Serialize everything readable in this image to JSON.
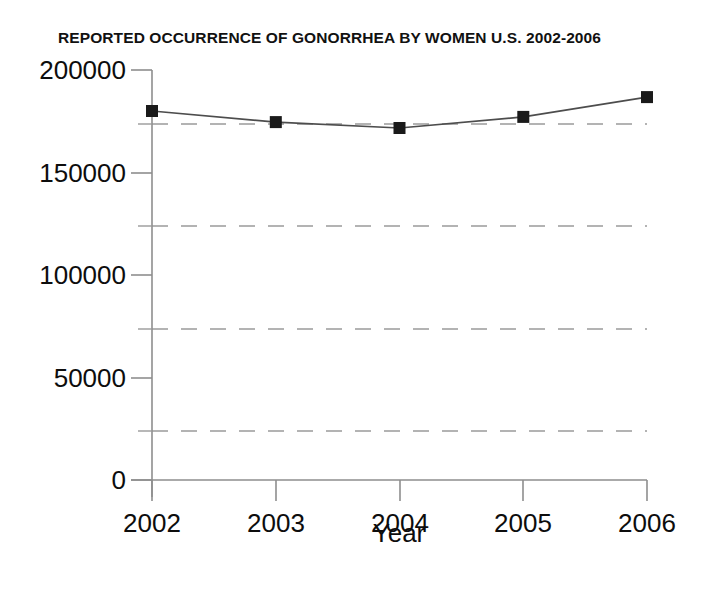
{
  "chart_data": {
    "type": "line",
    "title": "REPORTED OCCURRENCE OF GONORRHEA BY WOMEN U.S. 2002-2006",
    "xlabel": "Year",
    "ylabel": "",
    "categories": [
      "2002",
      "2003",
      "2004",
      "2005",
      "2006"
    ],
    "x": [
      2002,
      2003,
      2004,
      2005,
      2006
    ],
    "values": [
      180000,
      174600,
      171700,
      177100,
      186800
    ],
    "series": [
      {
        "name": "Reported occurrence of gonorrhea by women",
        "values": [
          180000,
          174600,
          171700,
          177100,
          186800
        ]
      }
    ],
    "ylim": [
      0,
      200000
    ],
    "xlim": [
      2002,
      2006
    ],
    "y_major_ticks": [
      0,
      50000,
      100000,
      150000,
      200000
    ],
    "y_major_tick_labels": [
      "0",
      "50000",
      "100000",
      "150000",
      "200000"
    ],
    "y_minor_ticks": [
      25000,
      75000,
      125000,
      175000
    ],
    "x_ticks": [
      2002,
      2003,
      2004,
      2005,
      2006
    ],
    "x_tick_labels": [
      "2002",
      "2003",
      "2004",
      "2005",
      "2006"
    ],
    "gridlines": {
      "horizontal_dashed_at": [
        25000,
        75000,
        125000,
        175000
      ],
      "vertical": false
    },
    "marker": "square",
    "marker_color": "#1a1a1a",
    "line_color": "#555555",
    "background_color": "#ffffff",
    "legend": null,
    "legend_position": "none",
    "annotations": []
  },
  "axes": {
    "y_labels": [
      "200000",
      "150000",
      "100000",
      "50000",
      "0"
    ],
    "x_labels": [
      "2002",
      "2003",
      "2004",
      "2005",
      "2006"
    ],
    "x_axis_title": "Year"
  }
}
